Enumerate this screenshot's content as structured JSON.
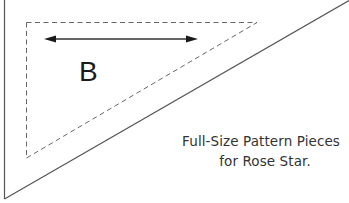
{
  "diagram": {
    "type": "quilt-pattern-template",
    "piece": {
      "label": "B",
      "shape": "right-triangle"
    },
    "grainline_arrow": {
      "direction": "horizontal",
      "double_headed": true
    },
    "caption": {
      "line1": "Full-Size Pattern Pieces",
      "line2": "for Rose Star."
    },
    "lines": {
      "cutting_line": "solid",
      "seam_line": "dashed"
    },
    "colors": {
      "background": "#ffffff",
      "line": "#555555",
      "dashed": "#666666",
      "text": "#1a1a1a"
    }
  }
}
